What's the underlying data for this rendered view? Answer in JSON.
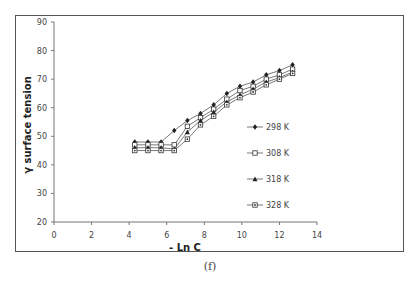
{
  "chart_data": {
    "type": "line",
    "title": "",
    "xlabel": "- Ln C",
    "ylabel": "γ surface tension",
    "xlim": [
      0,
      14
    ],
    "ylim": [
      20,
      90
    ],
    "xticks": [
      0,
      2,
      4,
      6,
      8,
      10,
      12,
      14
    ],
    "yticks": [
      20,
      30,
      40,
      50,
      60,
      70,
      80,
      90
    ],
    "grid": false,
    "legend_position": "right-inside",
    "x": [
      4.3,
      5.0,
      5.7,
      6.4,
      7.1,
      7.8,
      8.5,
      9.2,
      9.9,
      10.6,
      11.3,
      12.0,
      12.7
    ],
    "series": [
      {
        "name": "298 K",
        "marker": "diamond-filled",
        "values": [
          48,
          48,
          48,
          52,
          55.5,
          58,
          61,
          65,
          67.5,
          69,
          71.5,
          73,
          75
        ]
      },
      {
        "name": "308 K",
        "marker": "square-open",
        "values": [
          47,
          47,
          47,
          47,
          53.5,
          56.5,
          59.5,
          63,
          66,
          67.5,
          70,
          71.5,
          73.5
        ]
      },
      {
        "name": "318 K",
        "marker": "triangle-filled",
        "values": [
          46,
          46,
          46,
          45.5,
          51.5,
          55.5,
          58.5,
          62,
          64.5,
          66.5,
          69,
          70.5,
          72.5
        ]
      },
      {
        "name": "328 K",
        "marker": "circle-in-square",
        "values": [
          45,
          45,
          45,
          45,
          49,
          54,
          57,
          61,
          63.5,
          65.5,
          68,
          70,
          72
        ]
      }
    ]
  },
  "caption": "(f)"
}
